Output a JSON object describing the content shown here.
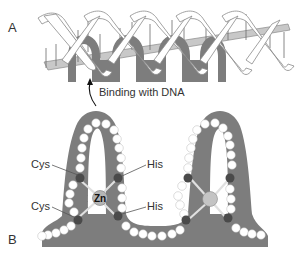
{
  "panels": {
    "a": {
      "label": "A"
    },
    "b": {
      "label": "B"
    }
  },
  "annotation": {
    "binding": "Binding with DNA"
  },
  "residues": {
    "cys_top": "Cys",
    "cys_bottom": "Cys",
    "his_top": "His",
    "his_bottom": "His",
    "zinc": "Zn"
  },
  "colors": {
    "protein": "#7d7d7d",
    "ribbon_fill": "#ffffff",
    "ribbon_stroke": "#8a8a8a",
    "backbone": "#c8c8c8",
    "residue_white": "#ffffff",
    "residue_dark": "#4a4a4a",
    "zinc": "#b5b5b5"
  }
}
